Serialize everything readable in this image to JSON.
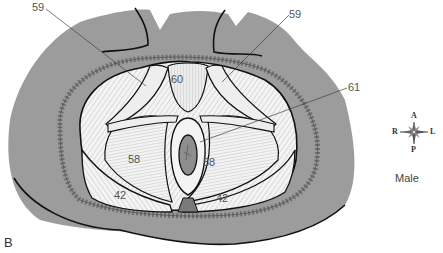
{
  "figure": {
    "panel_letter": "B",
    "sex_label": "Male",
    "colors": {
      "body_gray": "#9a9a9a",
      "outline": "#111111",
      "muscle_fill": "#f2f2f2",
      "label_text": "#555555",
      "leader_line": "#444444"
    }
  },
  "labels": [
    {
      "id": "59-left",
      "text": "59"
    },
    {
      "id": "59-right",
      "text": "59"
    },
    {
      "id": "60",
      "text": "60"
    },
    {
      "id": "61",
      "text": "61"
    },
    {
      "id": "58-left",
      "text": "58"
    },
    {
      "id": "58-right",
      "text": "58"
    },
    {
      "id": "42-left",
      "text": "42"
    },
    {
      "id": "42-right",
      "text": "42"
    }
  ],
  "compass": {
    "anterior": "A",
    "posterior": "P",
    "right": "R",
    "left": "L"
  }
}
